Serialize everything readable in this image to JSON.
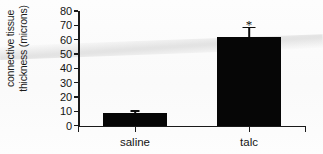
{
  "chart_data": {
    "type": "bar",
    "title": "",
    "subtitle": "",
    "xlabel": "",
    "ylabel": "connective tissue thickness (microns)",
    "ylabel_line1": "connective tissue",
    "ylabel_line2": "thickness (microns)",
    "categories": [
      "saline",
      "talc"
    ],
    "values": [
      9,
      62
    ],
    "errors": [
      1.5,
      7
    ],
    "yticks": [
      0,
      10,
      20,
      30,
      40,
      50,
      60,
      70,
      80
    ],
    "ytick_labels": [
      "0",
      "10",
      "20",
      "30",
      "40",
      "50",
      "60",
      "70",
      "80"
    ],
    "ylim": [
      0,
      80
    ],
    "grid": false,
    "legend": false,
    "legend_position": "none",
    "bar_color": "#060606",
    "axis_color": "#1a1a1a",
    "background": "#ffffff",
    "annotations": [
      {
        "text": "*",
        "category": "talc",
        "value": 75,
        "meaning": "significance-marker"
      }
    ]
  }
}
